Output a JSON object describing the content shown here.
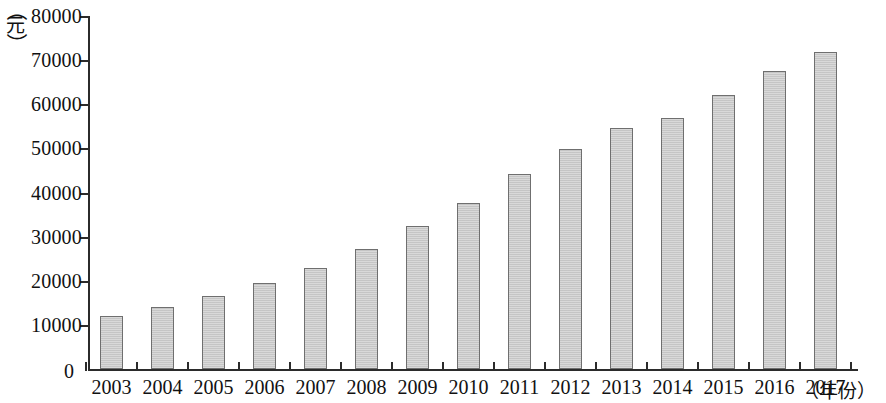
{
  "chart_data": {
    "type": "bar",
    "title": "",
    "subtitle": "",
    "xlabel": "（年份）",
    "ylabel": "（元）",
    "ylim": [
      0,
      80000
    ],
    "ytick_step": 10000,
    "grid": false,
    "legend": null,
    "bar_fill_color": "#c9c9c9",
    "bar_border_color": "#6f6f6f",
    "axis_color": "#2b2b2b",
    "categories": [
      "2003",
      "2004",
      "2005",
      "2006",
      "2007",
      "2008",
      "2009",
      "2010",
      "2011",
      "2012",
      "2013",
      "2014",
      "2015",
      "2016",
      "2017"
    ],
    "values": [
      12000,
      14100,
      16600,
      19500,
      22900,
      27300,
      32400,
      37700,
      44100,
      49900,
      54700,
      57000,
      62200,
      67500,
      71800
    ],
    "ytick_labels": [
      "0",
      "10000",
      "20000",
      "30000",
      "40000",
      "50000",
      "60000",
      "70000",
      "80000"
    ],
    "ytick_values": [
      0,
      10000,
      20000,
      30000,
      40000,
      50000,
      60000,
      70000,
      80000
    ]
  },
  "axis": {
    "y_unit_char": "元",
    "y_unit_open": "（",
    "y_unit_close": "）",
    "x_unit_text": "（年份）",
    "x_unit_open": "（",
    "x_unit_char": "年份",
    "x_unit_close": "）",
    "zero_label": "0"
  }
}
